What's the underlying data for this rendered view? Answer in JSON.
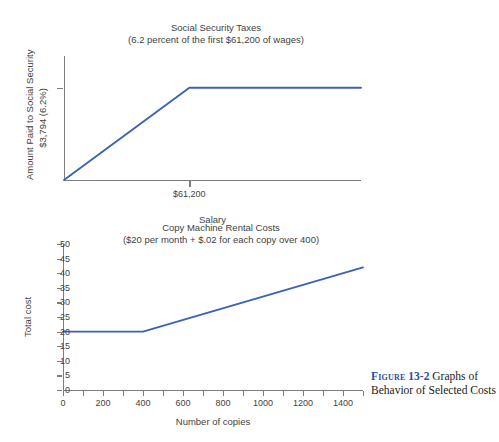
{
  "figure": {
    "label": "Figure",
    "number": "13-2",
    "caption": "Graphs of Behavior of Selected Costs",
    "accent_color": "#2a4fa2"
  },
  "colors": {
    "series_line": "#3b62b8",
    "axis": "#7d7d7d",
    "text": "#3f3f3f",
    "background": "#ffffff"
  },
  "chart_data": [
    {
      "id": "social-security",
      "type": "line",
      "title": "Social Security Taxes",
      "subtitle": "(6.2 percent of the first $61,200 of wages)",
      "xlabel": "Salary",
      "ylabel_lines": [
        "Amount Paid to Social Security",
        "$3,794 (6.2%)"
      ],
      "xticks": [
        {
          "value": 61200,
          "label": "$61,200"
        }
      ],
      "yticks": [
        {
          "value": 3794,
          "label": ""
        }
      ],
      "xlim": [
        0,
        145000
      ],
      "ylim": [
        0,
        5100
      ],
      "grid": false,
      "legend": "none",
      "series": [
        {
          "name": "Social Security tax paid",
          "x": [
            0,
            61200,
            145000
          ],
          "y": [
            0,
            3794,
            3794
          ]
        }
      ]
    },
    {
      "id": "copy-machine",
      "type": "line",
      "title": "Copy Machine Rental Costs",
      "subtitle": "($20 per month + $.02 for each copy over 400)",
      "xlabel": "Number of copies",
      "ylabel_lines": [
        "Total cost"
      ],
      "xticks": [
        {
          "value": 0,
          "label": "0"
        },
        {
          "value": 100,
          "label": ""
        },
        {
          "value": 200,
          "label": "200"
        },
        {
          "value": 300,
          "label": ""
        },
        {
          "value": 400,
          "label": "400"
        },
        {
          "value": 500,
          "label": ""
        },
        {
          "value": 600,
          "label": "600"
        },
        {
          "value": 700,
          "label": ""
        },
        {
          "value": 800,
          "label": "800"
        },
        {
          "value": 900,
          "label": ""
        },
        {
          "value": 1000,
          "label": "1000"
        },
        {
          "value": 1100,
          "label": ""
        },
        {
          "value": 1200,
          "label": "1200"
        },
        {
          "value": 1300,
          "label": ""
        },
        {
          "value": 1400,
          "label": "1400"
        },
        {
          "value": 1500,
          "label": ""
        }
      ],
      "yticks": [
        {
          "value": 0,
          "label": "0"
        },
        {
          "value": 5,
          "label": "5"
        },
        {
          "value": 10,
          "label": "10"
        },
        {
          "value": 15,
          "label": "15"
        },
        {
          "value": 20,
          "label": "20"
        },
        {
          "value": 25,
          "label": "25"
        },
        {
          "value": 30,
          "label": "30"
        },
        {
          "value": 35,
          "label": "35"
        },
        {
          "value": 40,
          "label": "40"
        },
        {
          "value": 45,
          "label": "45"
        },
        {
          "value": 50,
          "label": "50"
        }
      ],
      "xlim": [
        0,
        1500
      ],
      "ylim": [
        0,
        50
      ],
      "grid": false,
      "legend": "none",
      "series": [
        {
          "name": "Total rental cost",
          "x": [
            0,
            400,
            1500
          ],
          "y": [
            20,
            20,
            42
          ]
        }
      ]
    }
  ]
}
